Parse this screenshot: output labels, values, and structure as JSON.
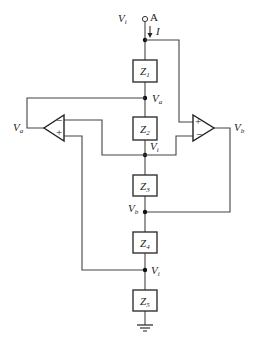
{
  "diagram": {
    "type": "circuit",
    "terminal": {
      "voltage": "V",
      "voltage_sub": "i",
      "name": "A",
      "current": "I"
    },
    "impedances": [
      {
        "id": "Z1",
        "label": "Z",
        "sub": "1"
      },
      {
        "id": "Z2",
        "label": "Z",
        "sub": "2"
      },
      {
        "id": "Z3",
        "label": "Z",
        "sub": "3"
      },
      {
        "id": "Z4",
        "label": "Z",
        "sub": "4"
      },
      {
        "id": "Z5",
        "label": "Z",
        "sub": "5"
      }
    ],
    "nodes": [
      {
        "label": "V",
        "sub": "a"
      },
      {
        "label": "V",
        "sub": "i"
      },
      {
        "label": "V",
        "sub": "b"
      },
      {
        "label": "V",
        "sub": "i"
      }
    ],
    "opamps": [
      {
        "id": "left",
        "output_label": "V",
        "output_sub": "a",
        "minus": "−",
        "plus": "+"
      },
      {
        "id": "right",
        "output_label": "V",
        "output_sub": "b",
        "minus": "−",
        "plus": "+"
      }
    ],
    "ground": "ground"
  }
}
